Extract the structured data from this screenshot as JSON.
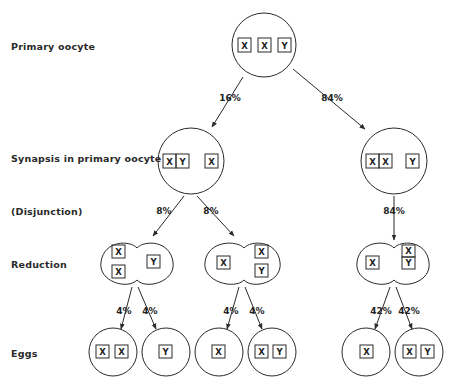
{
  "stages": {
    "primary_oocyte": "Primary oocyte",
    "synapsis": "Synapsis in primary oocyte",
    "disjunction": "(Disjunction)",
    "reduction": "Reduction",
    "eggs": "Eggs"
  },
  "percentages": {
    "top_left": "16%",
    "top_right": "84%",
    "disj_left_a": "8%",
    "disj_left_b": "8%",
    "disj_right": "84%",
    "red1_a": "4%",
    "red1_b": "4%",
    "red2_a": "4%",
    "red2_b": "4%",
    "red3_a": "42%",
    "red3_b": "42%"
  },
  "nodes": {
    "primary": {
      "chromosomes": [
        "X",
        "X",
        "Y"
      ]
    },
    "synapsis_left": {
      "paired": [
        "X",
        "Y"
      ],
      "single": [
        "X"
      ]
    },
    "synapsis_right": {
      "paired": [
        "X",
        "X"
      ],
      "single": [
        "Y"
      ]
    },
    "reduction_1": {
      "left_pole": [
        "X",
        "X"
      ],
      "right_pole": [
        "Y"
      ]
    },
    "reduction_2": {
      "left_pole": [
        "X"
      ],
      "right_pole": [
        "X",
        "Y"
      ]
    },
    "reduction_3": {
      "left_pole": [
        "X"
      ],
      "right_pole_paired": [
        "X",
        "Y"
      ]
    },
    "eggs": [
      {
        "chromosomes": [
          "X",
          "X"
        ]
      },
      {
        "chromosomes": [
          "Y"
        ]
      },
      {
        "chromosomes": [
          "X"
        ]
      },
      {
        "chromosomes": [
          "X",
          "Y"
        ]
      },
      {
        "chromosomes": [
          "X"
        ]
      },
      {
        "chromosomes": [
          "X",
          "Y"
        ]
      }
    ]
  },
  "colors": {
    "ink": "#2a2a2a",
    "background": "#ffffff"
  }
}
